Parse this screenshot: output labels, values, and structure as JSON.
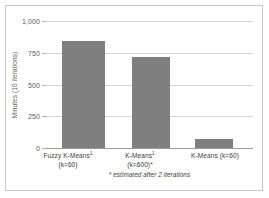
{
  "chart_data": {
    "type": "bar",
    "title": "",
    "xlabel": "",
    "ylabel": "Minutes (10 iterations)",
    "categories": [
      "Fuzzy K-Means¹ (k=60)",
      "K-Means¹ (k=600)*",
      "K-Means (k=60)"
    ],
    "category_lines": [
      {
        "line1": "Fuzzy K-Means",
        "superscript": "1",
        "line2": "(k=60)"
      },
      {
        "line1": "K-Means",
        "superscript": "1",
        "line2": "(k=600)*"
      },
      {
        "line1": "K-Means (k=60)",
        "superscript": "",
        "line2": ""
      }
    ],
    "values": [
      840,
      720,
      70
    ],
    "ylim": [
      0,
      1000
    ],
    "yticks": [
      0,
      250,
      500,
      750,
      1000
    ],
    "ytick_labels": [
      "0",
      "250",
      "500",
      "750",
      "1,000"
    ],
    "grid": true,
    "legend": "none",
    "bar_color": "#7f7f7f",
    "grid_color": "#d6d6d6",
    "axis_color": "#9a9a9a",
    "footnote": "* estimated after 2 iterations"
  }
}
